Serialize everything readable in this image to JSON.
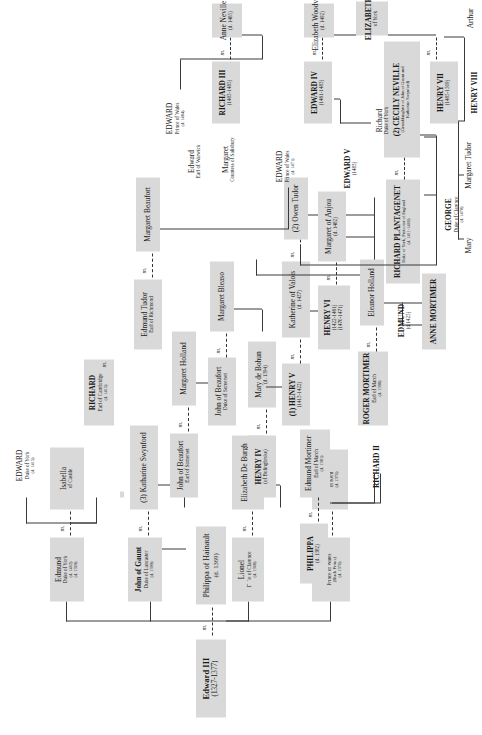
{
  "chart": {
    "marriage_symbol": "m.",
    "colors": {
      "box_fill": "#d9d9d9",
      "line": "#3a3a3a",
      "text": "#1a1a1a",
      "page": "#ffffff"
    }
  },
  "people": {
    "edward3": {
      "name": "Edward III",
      "l2": "(1327-1377)",
      "l3": ""
    },
    "philippa_h": {
      "name": "Philippa of Hainault",
      "l2": "(d. 1369)",
      "l3": ""
    },
    "edward_bp": {
      "name": "Edward",
      "l2": "Prince of Wales",
      "l3": "(Black Prince)",
      "l4": "(d. 1376)"
    },
    "joan_kent": {
      "name": "JOAN",
      "l2": "of Kent",
      "l3": "(d. 1376)"
    },
    "lionel": {
      "name": "Lionel",
      "l2": "Duke of Clarence",
      "l3": "(d. 1368)"
    },
    "elizabeth_db": {
      "name": "Elizabeth De Burgh",
      "l2": "(d. 1363)",
      "l3": ""
    },
    "john_gaunt": {
      "name": "John of Gaunt",
      "l2": "Duke of Lancaster",
      "l3": "(d. 1399)"
    },
    "blanche": {
      "name": "(1) Blanche",
      "l2": "of Lancaster",
      "l3": "(d. 1369)"
    },
    "katharine_s": {
      "name": "(3) Katharine Swynford",
      "l2": "",
      "l3": ""
    },
    "edmund_york": {
      "name": "Edmund",
      "l2": "Duke of York",
      "l3": "(d. 1402)",
      "l4": "(d. 1369)"
    },
    "isabella_c": {
      "name": "Isabella",
      "l2": "of Castile",
      "l3": ""
    },
    "richard2": {
      "name": "RICHARD II",
      "l2": "",
      "l3": ""
    },
    "philippa_m": {
      "name": "PHILIPPA",
      "l2": "(d. 1382)",
      "l3": ""
    },
    "edmund_mortimer": {
      "name": "Edmund Mortimer",
      "l2": "Earl of March",
      "l3": "(d. 1381)"
    },
    "henry4": {
      "name": "HENRY IV",
      "l2": "(of Bolingbroke)",
      "l3": ""
    },
    "mary_bohun": {
      "name": "Mary de Bohun",
      "l2": "(d. 1394)",
      "l3": ""
    },
    "john_beaufort_es": {
      "name": "John of Beaufort",
      "l2": "Earl of Somerset",
      "l3": ""
    },
    "margaret_holland": {
      "name": "Margaret Holland",
      "l2": "",
      "l3": ""
    },
    "edward_york": {
      "name": "EDWARD",
      "l2": "Duke of York",
      "l3": "(d. 1415)"
    },
    "roger_mortimer": {
      "name": "ROGER MORTIMER",
      "l2": "Earl of March",
      "l3": "(d. 1398)"
    },
    "eleanor_holland": {
      "name": "Eleanor Holland",
      "l2": "",
      "l3": ""
    },
    "henry5": {
      "name": "(1) HENRY V",
      "l2": "(1413-1422)",
      "l3": ""
    },
    "katherine_valois": {
      "name": "Katherine of Valois",
      "l2": "(d. 1437)",
      "l3": ""
    },
    "owen_tudor": {
      "name": "(2) Owen Tudor",
      "l2": "",
      "l3": ""
    },
    "richard_cambridge": {
      "name": "RICHARD",
      "l2": "Earl of Cambridge",
      "l3": "(d. 1415)"
    },
    "john_beaufort_ds": {
      "name": "John of Beaufort",
      "l2": "Duke of Somerset",
      "l3": ""
    },
    "margaret_bleaso": {
      "name": "Margaret Bleaso",
      "l2": "",
      "l3": ""
    },
    "edmund_mort2": {
      "name": "EDMUND",
      "l2": "(d.1425)",
      "l3": ""
    },
    "anne_mortimer": {
      "name": "ANNE MORTIMER",
      "l2": "",
      "l3": ""
    },
    "henry6": {
      "name": "HENRY VI",
      "l2": "(1422-1461)",
      "l3": "(1470-1471)"
    },
    "margaret_anjou": {
      "name": "Margaret of Anjou",
      "l2": "(d. 1482)",
      "l3": ""
    },
    "edmund_tudor": {
      "name": "Edmund Tudor",
      "l2": "Earl of Richmond",
      "l3": ""
    },
    "margaret_beaufort": {
      "name": "Margaret Beaufort",
      "l2": "",
      "l3": ""
    },
    "richard_plantagenet": {
      "name": "RICHARD PLANTAGENET",
      "l2": "Duke of York, Protector of England",
      "l3": "(d. 1411-1460)"
    },
    "cecily_neville": {
      "name": "(2) CECILY NEVILLE",
      "l2": "(Granddaughter of John of Gaunt and",
      "l3": "Katherine Swynford)"
    },
    "edward_pow1471": {
      "name": "EDWARD",
      "l2": "Prince of Wales",
      "l3": "(d. 1471)"
    },
    "edward4": {
      "name": "EDWARD IV",
      "l2": "(1461-1483)",
      "l3": ""
    },
    "elizabeth_wood": {
      "name": "Elizabeth Woodville",
      "l2": "(d. 1492)",
      "l3": ""
    },
    "george_clarence": {
      "name": "GEORGE",
      "l2": "Duke of Clarence",
      "l3": "(d. 1478)"
    },
    "richard3": {
      "name": "RICHARD III",
      "l2": "(1483-1485)",
      "l3": ""
    },
    "anne_neville": {
      "name": "Anne Neville",
      "l2": "(d. 1485)",
      "l3": ""
    },
    "henry7": {
      "name": "HENRY VII",
      "l2": "(1485-1509)",
      "l3": ""
    },
    "elizabeth_york": {
      "name": "ELIZABETH",
      "l2": "of York",
      "l3": ""
    },
    "edward5": {
      "name": "EDWARD V",
      "l2": "(1483)",
      "l3": ""
    },
    "richard_dy": {
      "name": "Richard",
      "l2": "Duke of York",
      "l3": ""
    },
    "edward_warwick": {
      "name": "Edward",
      "l2": "Earl of Warwick",
      "l3": ""
    },
    "margaret_salisbury": {
      "name": "Margaret",
      "l2": "Countess of Salisbury",
      "l3": ""
    },
    "edward_pow1484": {
      "name": "EDWARD",
      "l2": "Prince of Wales",
      "l3": "(d. 1484)"
    },
    "arthur": {
      "name": "Arthur",
      "l2": "",
      "l3": ""
    },
    "henry8": {
      "name": "HENRY VIII",
      "l2": "",
      "l3": ""
    },
    "margaret_tudor": {
      "name": "Margaret Tudor",
      "l2": "",
      "l3": ""
    },
    "mary_tudor": {
      "name": "Mary",
      "l2": "",
      "l3": ""
    }
  }
}
